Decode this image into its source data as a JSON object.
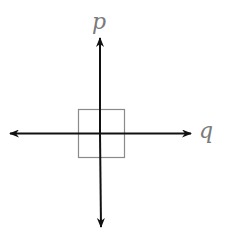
{
  "diagram": {
    "axis_labels": {
      "vertical": "p",
      "horizontal": "q"
    },
    "colors": {
      "axis": "#111111",
      "square": "#8a8a8a",
      "label": "#7a7a7a",
      "background": "#ffffff"
    },
    "elements": [
      "vertical double-headed arrow (p axis)",
      "horizontal double-headed arrow (q axis)",
      "square centered at the intersection"
    ]
  }
}
